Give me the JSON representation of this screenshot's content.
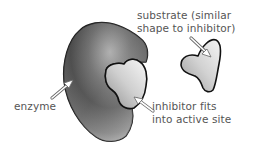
{
  "diagram": {
    "topic": "competitive inhibition",
    "colors": {
      "background": "#ffffff",
      "outline": "#1a1a1a",
      "enzyme_dark": "#4a4a4a",
      "enzyme_light": "#e8e8e8",
      "inhibitor_fill": "#c8c8c8",
      "substrate_fill": "#d0d0d0",
      "label_text": "#555555",
      "arrow_fill": "#ffffff"
    },
    "shapes": [
      {
        "id": "enzyme",
        "name": "enzyme"
      },
      {
        "id": "inhibitor",
        "name": "inhibitor (in active site)"
      },
      {
        "id": "substrate",
        "name": "substrate"
      }
    ],
    "labels": {
      "substrate": {
        "line1": "substrate (similar",
        "line2": "shape to inhibitor)"
      },
      "enzyme": {
        "line1": "enzyme"
      },
      "inhibitor": {
        "line1": "inhibitor fits",
        "line2": "into active site"
      }
    }
  }
}
